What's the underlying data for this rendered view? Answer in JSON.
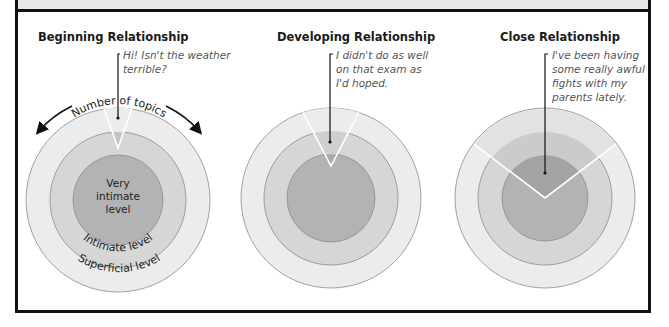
{
  "figure": {
    "colors": {
      "superficial": "#ececec",
      "intimate": "#d6d6d6",
      "very_intimate": "#b3b3b3",
      "ring_stroke": "#8c8c8c",
      "frame": "#111111"
    },
    "panels": [
      {
        "title": "Beginning Relationship",
        "quote_lines": [
          "Hi! Isn't the weather",
          "terrible?"
        ],
        "depth_level": "superficial",
        "breadth": "narrow"
      },
      {
        "title": "Developing Relationship",
        "quote_lines": [
          "I didn't do as well",
          "on that exam as",
          "I'd hoped."
        ],
        "depth_level": "intimate",
        "breadth": "medium"
      },
      {
        "title": "Close Relationship",
        "quote_lines": [
          "I've been having",
          "some really awful",
          "fights with my",
          "parents lately."
        ],
        "depth_level": "very intimate",
        "breadth": "wide"
      }
    ],
    "labels": {
      "number_of_topics": "Number of topics",
      "very_intimate_lines": [
        "Very",
        "intimate",
        "level"
      ],
      "intimate_level": "Intimate level",
      "superficial_level": "Superficial level"
    }
  }
}
